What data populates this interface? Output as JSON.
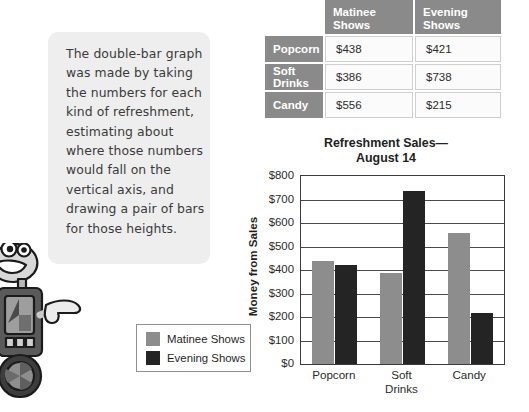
{
  "callout": {
    "text": "The double-bar graph was made by taking the numbers for each kind of refreshment, estimating about where those numbers would fall on the vertical axis, and drawing a pair of bars for those heights."
  },
  "table": {
    "corner_label": "",
    "column_headers": [
      "Matinee Shows",
      "Evening Shows"
    ],
    "rows": [
      {
        "label": "Popcorn",
        "matinee": "$438",
        "evening": "$421"
      },
      {
        "label": "Soft Drinks",
        "matinee": "$386",
        "evening": "$738"
      },
      {
        "label": "Candy",
        "matinee": "$556",
        "evening": "$215"
      }
    ],
    "header_bg": "#8a8a8a",
    "cell_bg": "#fbfbfb"
  },
  "chart_data": {
    "type": "bar",
    "title": "Refreshment Sales—\nAugust 14",
    "title_line1": "Refreshment Sales—",
    "title_line2": "August 14",
    "xlabel": "",
    "ylabel": "Money from Sales",
    "categories": [
      "Popcorn",
      "Soft Drinks",
      "Candy"
    ],
    "category_lines": [
      [
        "Popcorn"
      ],
      [
        "Soft",
        "Drinks"
      ],
      [
        "Candy"
      ]
    ],
    "series": [
      {
        "name": "Matinee Shows",
        "color": "#8d8d8d",
        "values": [
          438,
          386,
          556
        ]
      },
      {
        "name": "Evening Shows",
        "color": "#242424",
        "values": [
          421,
          738,
          215
        ]
      }
    ],
    "ylim": [
      0,
      800
    ],
    "ytick_values": [
      0,
      100,
      200,
      300,
      400,
      500,
      600,
      700,
      800
    ],
    "ytick_labels": [
      "$0",
      "$100",
      "$200",
      "$300",
      "$400",
      "$500",
      "$600",
      "$700",
      "$800"
    ],
    "grid": true,
    "legend_position": "outside-left"
  },
  "legend": {
    "entries": [
      {
        "label": "Matinee Shows",
        "color": "#8d8d8d"
      },
      {
        "label": "Evening Shows",
        "color": "#242424"
      }
    ]
  },
  "mascot": {
    "name": "robot-mascot",
    "description": "smiling robot pointing right"
  }
}
